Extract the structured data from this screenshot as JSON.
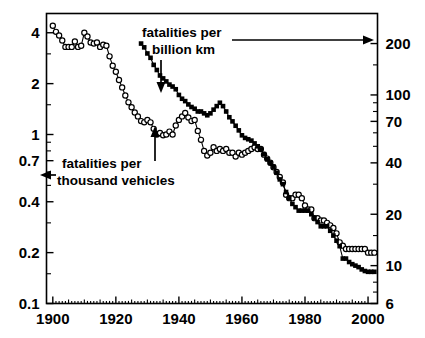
{
  "chart_data": {
    "type": "line",
    "title": "",
    "xlabel": "",
    "ylabel": "",
    "xlim": [
      1898,
      2003
    ],
    "grid": false,
    "legend_position": "inline-annotations",
    "x_ticks_major": [
      1900,
      1920,
      1940,
      1960,
      1980,
      2000
    ],
    "x_tick_labels": [
      "1900",
      "1920",
      "1940",
      "1960",
      "1980",
      "2000"
    ],
    "x_ticks_minor_step": 5,
    "left_axis": {
      "scale": "log",
      "ylim": [
        0.1,
        5.2
      ],
      "ticks": [
        4,
        2,
        1,
        0.7,
        0.4,
        0.2,
        0.1
      ],
      "tick_labels": [
        "4",
        "2",
        "1",
        "0.7",
        "0.4",
        "0.2",
        "0.1"
      ],
      "minor_ticks": [
        3,
        1.5,
        0.9,
        0.8,
        0.6,
        0.5,
        0.3,
        0.15
      ],
      "label": "fatalities per thousand vehicles"
    },
    "right_axis": {
      "scale": "log",
      "ylim": [
        6,
        300
      ],
      "ticks": [
        200,
        100,
        70,
        40,
        20,
        10,
        6
      ],
      "tick_labels": [
        "200",
        "100",
        "70",
        "40",
        "20",
        "10",
        "6"
      ],
      "minor_ticks": [
        150,
        90,
        80,
        60,
        50,
        30,
        15,
        8,
        7
      ],
      "label": "fatalities per billion km"
    },
    "series": [
      {
        "name": "fatalities per thousand vehicles",
        "axis": "left",
        "marker": "open-circle",
        "color": "#000000",
        "x": [
          1900,
          1901,
          1902,
          1903,
          1904,
          1905,
          1906,
          1907,
          1908,
          1909,
          1910,
          1911,
          1912,
          1913,
          1914,
          1915,
          1916,
          1917,
          1918,
          1919,
          1920,
          1921,
          1922,
          1923,
          1924,
          1925,
          1926,
          1927,
          1928,
          1929,
          1930,
          1931,
          1932,
          1933,
          1934,
          1935,
          1936,
          1937,
          1938,
          1939,
          1940,
          1941,
          1942,
          1943,
          1944,
          1945,
          1946,
          1947,
          1948,
          1949,
          1950,
          1951,
          1952,
          1953,
          1954,
          1955,
          1956,
          1957,
          1958,
          1959,
          1960,
          1961,
          1962,
          1963,
          1964,
          1965,
          1966,
          1967,
          1968,
          1969,
          1970,
          1971,
          1972,
          1973,
          1974,
          1975,
          1976,
          1977,
          1978,
          1979,
          1980,
          1981,
          1982,
          1983,
          1984,
          1985,
          1986,
          1987,
          1988,
          1989,
          1990,
          1991,
          1992,
          1993,
          1994,
          1995,
          1996,
          1997,
          1998,
          1999,
          2000,
          2001,
          2002
        ],
        "y": [
          4.4,
          4.05,
          3.85,
          3.6,
          3.3,
          3.3,
          3.3,
          3.55,
          3.3,
          3.35,
          4.0,
          3.8,
          3.5,
          3.45,
          3.5,
          3.3,
          3.4,
          3.35,
          2.9,
          2.55,
          2.35,
          2.1,
          1.9,
          1.7,
          1.55,
          1.45,
          1.35,
          1.28,
          1.2,
          1.18,
          1.22,
          1.18,
          1.08,
          1.0,
          1.02,
          0.99,
          1.0,
          1.04,
          1.0,
          1.13,
          1.22,
          1.28,
          1.34,
          1.26,
          1.2,
          1.22,
          1.05,
          0.93,
          0.8,
          0.75,
          0.78,
          0.84,
          0.8,
          0.82,
          0.8,
          0.82,
          0.78,
          0.78,
          0.74,
          0.78,
          0.76,
          0.78,
          0.8,
          0.82,
          0.84,
          0.82,
          0.82,
          0.76,
          0.72,
          0.68,
          0.64,
          0.6,
          0.56,
          0.52,
          0.44,
          0.42,
          0.42,
          0.44,
          0.44,
          0.42,
          0.38,
          0.36,
          0.36,
          0.32,
          0.32,
          0.31,
          0.31,
          0.3,
          0.29,
          0.28,
          0.26,
          0.23,
          0.22,
          0.21,
          0.21,
          0.21,
          0.21,
          0.21,
          0.21,
          0.21,
          0.2,
          0.2,
          0.2
        ]
      },
      {
        "name": "fatalities per billion km",
        "axis": "right",
        "marker": "filled-square",
        "color": "#000000",
        "x": [
          1928,
          1929,
          1930,
          1931,
          1932,
          1933,
          1934,
          1935,
          1936,
          1937,
          1938,
          1939,
          1940,
          1941,
          1942,
          1943,
          1944,
          1945,
          1946,
          1947,
          1948,
          1949,
          1950,
          1951,
          1952,
          1953,
          1954,
          1955,
          1956,
          1957,
          1958,
          1959,
          1960,
          1961,
          1962,
          1963,
          1964,
          1965,
          1966,
          1967,
          1968,
          1969,
          1970,
          1971,
          1972,
          1973,
          1974,
          1975,
          1976,
          1977,
          1978,
          1979,
          1980,
          1981,
          1982,
          1983,
          1984,
          1985,
          1986,
          1987,
          1988,
          1989,
          1990,
          1991,
          1992,
          1993,
          1994,
          1995,
          1996,
          1997,
          1998,
          1999,
          2000,
          2001,
          2002
        ],
        "y": [
          200,
          190,
          175,
          165,
          150,
          140,
          130,
          125,
          120,
          115,
          112,
          108,
          100,
          95,
          92,
          88,
          85,
          83,
          80,
          80,
          78,
          76,
          78,
          82,
          86,
          90,
          86,
          80,
          74,
          70,
          66,
          62,
          58,
          56,
          55,
          54,
          52,
          50,
          48,
          45,
          42,
          40,
          38,
          35,
          32,
          30,
          27,
          25,
          23,
          22,
          21,
          21,
          21,
          21,
          20,
          19,
          18,
          17,
          17,
          17,
          16,
          15,
          14,
          13,
          11,
          11,
          10.5,
          10.2,
          10.0,
          9.8,
          9.5,
          9.3,
          9.2,
          9.2,
          9.2
        ]
      }
    ],
    "annotations": [
      {
        "name": "fatalities-per-billion-km",
        "lines": [
          "fatalities per",
          "billion km"
        ],
        "arrow": "down-and-right"
      },
      {
        "name": "fatalities-per-thousand-vehicles",
        "lines": [
          "fatalities per",
          "thousand vehicles"
        ],
        "arrow": "left-and-up"
      }
    ]
  }
}
